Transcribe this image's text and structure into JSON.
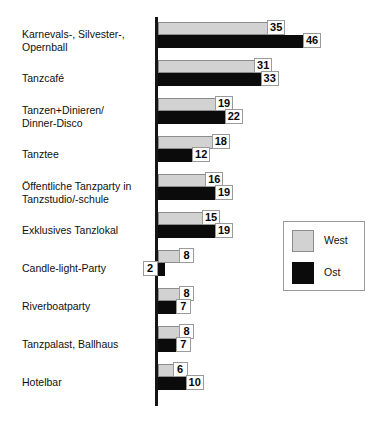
{
  "chart_data": {
    "type": "bar",
    "orientation": "horizontal",
    "title": "",
    "subtitle": "",
    "xlabel": "",
    "ylabel": "",
    "grid": false,
    "xlim": [
      0,
      50
    ],
    "legend_position": "middle-right",
    "categories": [
      "Karnevals-, Silvester-,\nOpernball",
      "Tanzcafé",
      "Tanzen+Dinieren/\nDinner-Disco",
      "Tanztee",
      "Öffentliche Tanzparty in\nTanzstudio/-schule",
      "Exklusives Tanzlokal",
      "Candle-light-Party",
      "Riverboatparty",
      "Tanzpalast, Ballhaus",
      "Hotelbar"
    ],
    "series": [
      {
        "name": "West",
        "color": "#d2d2d2",
        "values": [
          35,
          31,
          19,
          18,
          16,
          15,
          8,
          8,
          8,
          6
        ]
      },
      {
        "name": "Ost",
        "color": "#0b0b0b",
        "values": [
          46,
          33,
          22,
          12,
          19,
          19,
          2,
          7,
          7,
          10
        ]
      }
    ],
    "data_labels": [
      {
        "category": "Karnevals-, Silvester-, Opernball",
        "West": "35",
        "Ost": "46"
      },
      {
        "category": "Tanzcafé",
        "West": "31",
        "Ost": "33"
      },
      {
        "category": "Tanzen+Dinieren/Dinner-Disco",
        "West": "19",
        "Ost": "22"
      },
      {
        "category": "Tanztee",
        "West": "18",
        "Ost": "12"
      },
      {
        "category": "Öffentliche Tanzparty in Tanzstudio/-schule",
        "West": "16",
        "Ost": "19"
      },
      {
        "category": "Exklusives Tanzlokal",
        "West": "15",
        "Ost": "19"
      },
      {
        "category": "Candle-light-Party",
        "West": "8",
        "Ost": "2"
      },
      {
        "category": "Riverboatparty",
        "West": "8",
        "Ost": "7"
      },
      {
        "category": "Tanzpalast, Ballhaus",
        "West": "8",
        "Ost": "7"
      },
      {
        "category": "Hotelbar",
        "West": "6",
        "Ost": "10"
      }
    ]
  },
  "legend": {
    "entries": [
      {
        "label": "West",
        "color": "#d2d2d2"
      },
      {
        "label": "Ost",
        "color": "#0b0b0b"
      }
    ]
  },
  "axis": {
    "color": "#151515"
  }
}
